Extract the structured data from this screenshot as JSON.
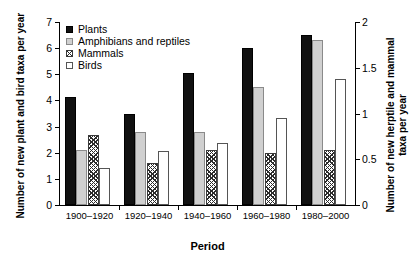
{
  "chart_data": {
    "type": "bar",
    "title": "",
    "xlabel": "Period",
    "ylabel": "Number of new plant and bird taxa per year",
    "ylabel_right_line1": "Number of new herptile and mammal",
    "ylabel_right_line2": "taxa per year",
    "categories": [
      "1900–1920",
      "1920–1940",
      "1940–1960",
      "1960–1980",
      "1980–2000"
    ],
    "ylim": [
      0,
      7
    ],
    "ylim_right": [
      0,
      2
    ],
    "yticks": [
      "0",
      "1",
      "2",
      "3",
      "4",
      "5",
      "6",
      "7"
    ],
    "yticks_right": [
      "0",
      "0.5",
      "1",
      "1.5",
      "2"
    ],
    "grid": false,
    "legend_position": "top-left",
    "series": [
      {
        "name": "Plants",
        "axis": "left",
        "style": "solid-black",
        "values": [
          4.15,
          3.5,
          5.05,
          6.0,
          6.5
        ]
      },
      {
        "name": "Amphibians and reptiles",
        "axis": "left",
        "style": "solid-grey",
        "values": [
          2.1,
          2.8,
          2.8,
          4.5,
          6.3
        ]
      },
      {
        "name": "Mammals",
        "axis": "right",
        "style": "hatched",
        "values": [
          0.76,
          0.46,
          0.6,
          0.57,
          0.6
        ]
      },
      {
        "name": "Birds",
        "axis": "right",
        "style": "open-white",
        "values": [
          0.4,
          0.59,
          0.68,
          0.95,
          1.38
        ]
      }
    ]
  },
  "legend": {
    "items": [
      {
        "label": "Plants",
        "key": "square-filled-black"
      },
      {
        "label": "Amphibians and reptiles",
        "key": "square-filled-grey"
      },
      {
        "label": "Mammals",
        "key": "square-hatched"
      },
      {
        "label": "Birds",
        "key": "square-open"
      }
    ]
  },
  "colors": {
    "plants": "#111111",
    "amphibians": "#d0d0d0",
    "mammals_hatch": "#2b2b2b",
    "birds": "#ffffff",
    "axis": "#000000"
  }
}
